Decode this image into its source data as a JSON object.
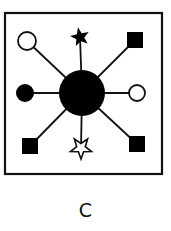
{
  "figure": {
    "caption": "C",
    "colors": {
      "stroke": "#111111",
      "fill": "#000000",
      "background": "#ffffff"
    }
  },
  "diagram": {
    "center": {
      "shape": "circle",
      "style": "filled",
      "x": 82,
      "y": 93,
      "r": 23
    },
    "satellites": [
      {
        "position": "top-left",
        "shape": "circle",
        "style": "hollow",
        "x": 27,
        "y": 41
      },
      {
        "position": "top",
        "shape": "star",
        "style": "filled",
        "x": 80,
        "y": 37
      },
      {
        "position": "top-right",
        "shape": "square",
        "style": "filled",
        "x": 135,
        "y": 40
      },
      {
        "position": "left",
        "shape": "circle",
        "style": "filled",
        "x": 25,
        "y": 93
      },
      {
        "position": "right",
        "shape": "circle",
        "style": "hollow",
        "x": 137,
        "y": 93
      },
      {
        "position": "bottom-left",
        "shape": "square",
        "style": "filled",
        "x": 30,
        "y": 146
      },
      {
        "position": "bottom",
        "shape": "star",
        "style": "hollow",
        "x": 81,
        "y": 148
      },
      {
        "position": "bottom-right",
        "shape": "square",
        "style": "filled",
        "x": 137,
        "y": 144
      }
    ]
  }
}
